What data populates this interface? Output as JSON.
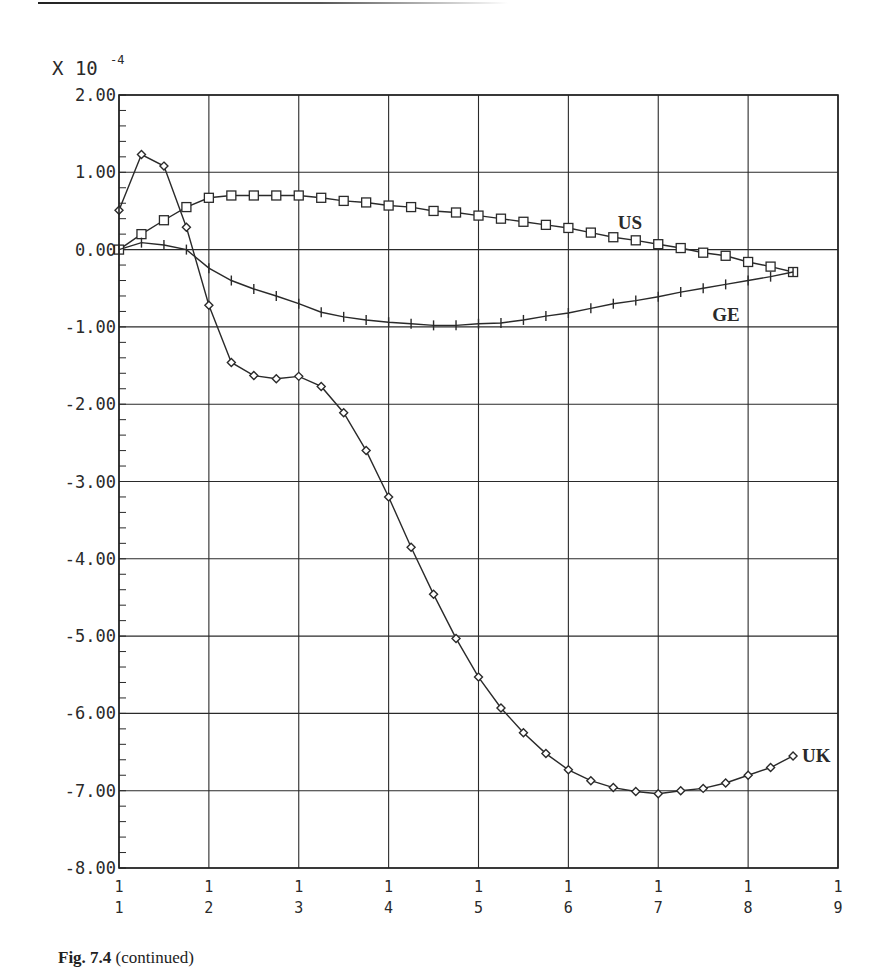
{
  "chart_data": {
    "type": "line",
    "title": "",
    "scale_label": "X 10",
    "scale_exponent": "-4",
    "xlabel": "",
    "ylabel": "",
    "xlim": [
      1,
      9
    ],
    "ylim": [
      -8.0,
      2.0
    ],
    "grid": true,
    "x_ticks": [
      {
        "x": 1,
        "top": "1",
        "bottom": "1"
      },
      {
        "x": 2,
        "top": "1",
        "bottom": "2"
      },
      {
        "x": 3,
        "top": "1",
        "bottom": "3"
      },
      {
        "x": 4,
        "top": "1",
        "bottom": "4"
      },
      {
        "x": 5,
        "top": "1",
        "bottom": "5"
      },
      {
        "x": 6,
        "top": "1",
        "bottom": "6"
      },
      {
        "x": 7,
        "top": "1",
        "bottom": "7"
      },
      {
        "x": 8,
        "top": "1",
        "bottom": "8"
      },
      {
        "x": 9,
        "top": "1",
        "bottom": "9"
      }
    ],
    "y_ticks": [
      {
        "y": 2,
        "label": "2.00"
      },
      {
        "y": 1,
        "label": "1.00"
      },
      {
        "y": 0,
        "label": "0.00"
      },
      {
        "y": -1,
        "label": "-1.00"
      },
      {
        "y": -2,
        "label": "-2.00"
      },
      {
        "y": -3,
        "label": "-3.00"
      },
      {
        "y": -4,
        "label": "-4.00"
      },
      {
        "y": -5,
        "label": "-5.00"
      },
      {
        "y": -6,
        "label": "-6.00"
      },
      {
        "y": -7,
        "label": "-7.00"
      },
      {
        "y": -8,
        "label": "-8.00"
      }
    ],
    "x": [
      1,
      1.25,
      1.5,
      1.75,
      2,
      2.25,
      2.5,
      2.75,
      3,
      3.25,
      3.5,
      3.75,
      4,
      4.25,
      4.5,
      4.75,
      5,
      5.25,
      5.5,
      5.75,
      6,
      6.25,
      6.5,
      6.75,
      7,
      7.25,
      7.5,
      7.75,
      8,
      8.25,
      8.5
    ],
    "series": [
      {
        "name": "US",
        "marker": "square",
        "label_pos": [
          6.55,
          0.35
        ],
        "values": [
          0.0,
          0.2,
          0.38,
          0.55,
          0.67,
          0.7,
          0.7,
          0.7,
          0.7,
          0.67,
          0.63,
          0.61,
          0.57,
          0.55,
          0.5,
          0.48,
          0.44,
          0.4,
          0.36,
          0.32,
          0.28,
          0.22,
          0.16,
          0.12,
          0.07,
          0.02,
          -0.04,
          -0.08,
          -0.16,
          -0.22,
          -0.29
        ]
      },
      {
        "name": "GE",
        "marker": "plus",
        "label_pos": [
          7.6,
          -0.85
        ],
        "values": [
          0.0,
          0.09,
          0.06,
          0.0,
          -0.24,
          -0.4,
          -0.51,
          -0.6,
          -0.7,
          -0.81,
          -0.87,
          -0.91,
          -0.94,
          -0.96,
          -0.98,
          -0.98,
          -0.96,
          -0.95,
          -0.91,
          -0.86,
          -0.82,
          -0.76,
          -0.7,
          -0.66,
          -0.61,
          -0.55,
          -0.5,
          -0.45,
          -0.4,
          -0.35,
          -0.29
        ]
      },
      {
        "name": "UK",
        "marker": "diamond",
        "label_pos": [
          8.6,
          -6.55
        ],
        "values": [
          0.51,
          1.23,
          1.08,
          0.29,
          -0.72,
          -1.46,
          -1.63,
          -1.67,
          -1.64,
          -1.77,
          -2.11,
          -2.6,
          -3.2,
          -3.85,
          -4.46,
          -5.03,
          -5.53,
          -5.93,
          -6.25,
          -6.52,
          -6.73,
          -6.87,
          -6.96,
          -7.01,
          -7.04,
          -7.0,
          -6.97,
          -6.9,
          -6.8,
          -6.7,
          -6.55
        ]
      }
    ]
  },
  "caption": {
    "fig_label": "Fig. 7.4",
    "text": " (continued)"
  }
}
